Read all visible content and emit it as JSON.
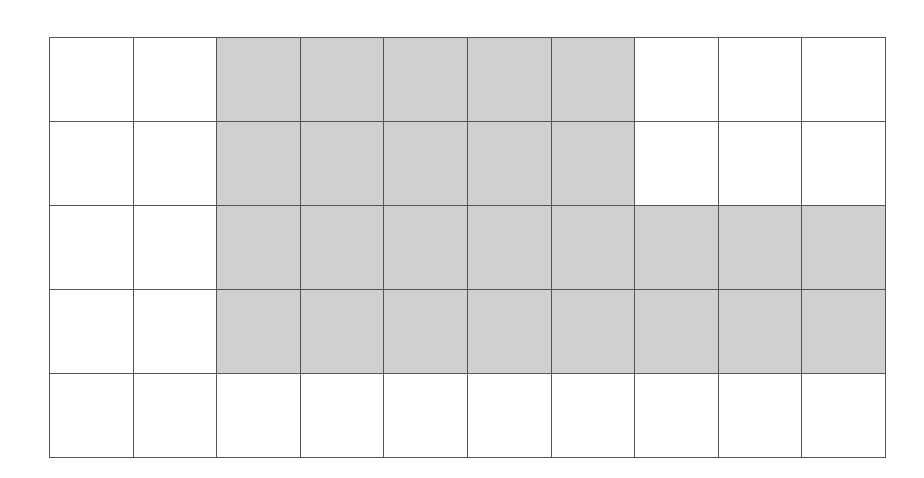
{
  "grid": {
    "rows": 5,
    "cols": 10,
    "shaded_color": "#d0d0d0",
    "empty_color": "#ffffff",
    "line_color": "#555555",
    "shaded": [
      [
        0,
        0,
        1,
        1,
        1,
        1,
        1,
        0,
        0,
        0
      ],
      [
        0,
        0,
        1,
        1,
        1,
        1,
        1,
        0,
        0,
        0
      ],
      [
        0,
        0,
        1,
        1,
        1,
        1,
        1,
        1,
        1,
        1
      ],
      [
        0,
        0,
        1,
        1,
        1,
        1,
        1,
        1,
        1,
        1
      ],
      [
        0,
        0,
        0,
        0,
        0,
        0,
        0,
        0,
        0,
        0
      ]
    ],
    "shaded_count": 26,
    "total_cells": 50
  }
}
